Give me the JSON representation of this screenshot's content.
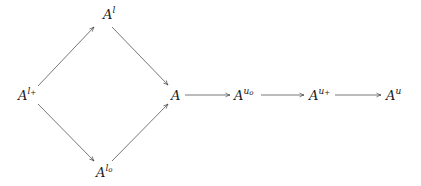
{
  "diagram": {
    "type": "commutative-diagram",
    "stroke_color": "#555555",
    "nodes": [
      {
        "id": "A_lplus",
        "base": "A",
        "sup": "l",
        "sub": "+",
        "x": 18,
        "y": 89
      },
      {
        "id": "A_l",
        "base": "A",
        "sup": "l",
        "sub": "",
        "x": 103,
        "y": 8
      },
      {
        "id": "A_lo",
        "base": "A",
        "sup": "l",
        "sub": "o",
        "x": 96,
        "y": 166
      },
      {
        "id": "A",
        "base": "A",
        "sup": "",
        "sub": "",
        "x": 171,
        "y": 89
      },
      {
        "id": "A_uo",
        "base": "A",
        "sup": "u",
        "sub": "o",
        "x": 234,
        "y": 89
      },
      {
        "id": "A_uplus",
        "base": "A",
        "sup": "u",
        "sub": "+",
        "x": 309,
        "y": 89
      },
      {
        "id": "A_u",
        "base": "A",
        "sup": "u",
        "sub": "",
        "x": 386,
        "y": 89
      }
    ],
    "edges": [
      {
        "from": "A_lplus",
        "to": "A_l",
        "x1": 38,
        "y1": 86,
        "x2": 94,
        "y2": 27
      },
      {
        "from": "A_l",
        "to": "A",
        "x1": 112,
        "y1": 27,
        "x2": 168,
        "y2": 85
      },
      {
        "from": "A_lplus",
        "to": "A_lo",
        "x1": 38,
        "y1": 104,
        "x2": 94,
        "y2": 161
      },
      {
        "from": "A_lo",
        "to": "A",
        "x1": 112,
        "y1": 161,
        "x2": 168,
        "y2": 104
      },
      {
        "from": "A",
        "to": "A_uo",
        "x1": 185,
        "y1": 95,
        "x2": 230,
        "y2": 95
      },
      {
        "from": "A_uo",
        "to": "A_uplus",
        "x1": 261,
        "y1": 95,
        "x2": 304,
        "y2": 95
      },
      {
        "from": "A_uplus",
        "to": "A_u",
        "x1": 335,
        "y1": 95,
        "x2": 381,
        "y2": 95
      }
    ]
  }
}
